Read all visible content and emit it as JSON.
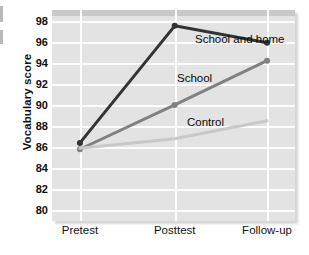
{
  "chart_data": {
    "type": "line",
    "title": "",
    "xlabel": "",
    "ylabel": "Vocabulary score",
    "categories": [
      "Pretest",
      "Posttest",
      "Follow-up"
    ],
    "ylim": [
      79,
      99
    ],
    "yticks": [
      98,
      96,
      94,
      92,
      90,
      88,
      86,
      84,
      82,
      80
    ],
    "grid": true,
    "legend_position": "inline-annotations",
    "series": [
      {
        "name": "School and home",
        "values": [
          86.4,
          97.5,
          95.9
        ],
        "color": "#333333",
        "markers": true
      },
      {
        "name": "School",
        "values": [
          85.8,
          90.0,
          94.2
        ],
        "color": "#808080",
        "markers": true
      },
      {
        "name": "Control",
        "values": [
          85.9,
          86.8,
          88.5
        ],
        "color": "#c8c8c8",
        "markers": false
      }
    ],
    "annotations": [
      {
        "text": "School and home",
        "series": "School and home"
      },
      {
        "text": "School",
        "series": "School"
      },
      {
        "text": "Control",
        "series": "Control"
      }
    ]
  },
  "axis": {
    "y_title": "Vocabulary score"
  }
}
